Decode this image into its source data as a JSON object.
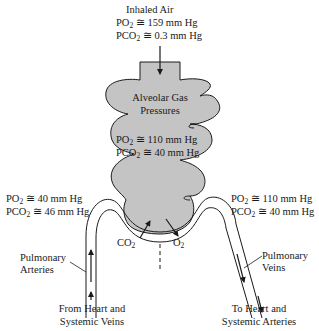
{
  "inhaled": {
    "title": "Inhaled Air",
    "po2_prefix": "PO",
    "po2_sub": "2",
    "po2_value": " ≅ 159 mm Hg",
    "pco2_prefix": "PCO",
    "pco2_sub": "2",
    "pco2_value": " ≅ 0.3 mm Hg"
  },
  "alveolar": {
    "title_line1": "Alveolar Gas",
    "title_line2": "Pressures",
    "po2_prefix": "PO",
    "po2_sub": "2",
    "po2_value": " ≅ 110 mm Hg",
    "pco2_prefix": "PCO",
    "pco2_sub": "2",
    "pco2_value": " ≅ 40 mm Hg"
  },
  "venous_blood": {
    "po2_prefix": "PO",
    "po2_sub": "2",
    "po2_value": " ≅ 40 mm Hg",
    "pco2_prefix": "PCO",
    "pco2_sub": "2",
    "pco2_value": " ≅ 46 mm Hg"
  },
  "arterial_blood": {
    "po2_prefix": "PO",
    "po2_sub": "2",
    "po2_value": " ≅ 110 mm Hg",
    "pco2_prefix": "PCO",
    "pco2_sub": "2",
    "pco2_value": " ≅ 40 mm Hg"
  },
  "exchange": {
    "co2_prefix": "CO",
    "co2_sub": "2",
    "o2_prefix": "O",
    "o2_sub": "2"
  },
  "vessels": {
    "left_line1": "Pulmonary",
    "left_line2": "Arteries",
    "right_line1": "Pulmonary",
    "right_line2": "Veins"
  },
  "flow": {
    "from_line1": "From Heart and",
    "from_line2": "Systemic Veins",
    "to_line1": "To Heart and",
    "to_line2": "Systemic Arteries"
  },
  "colors": {
    "alveolus_fill": "#c4c4c4",
    "stroke": "#1a1a1a"
  }
}
